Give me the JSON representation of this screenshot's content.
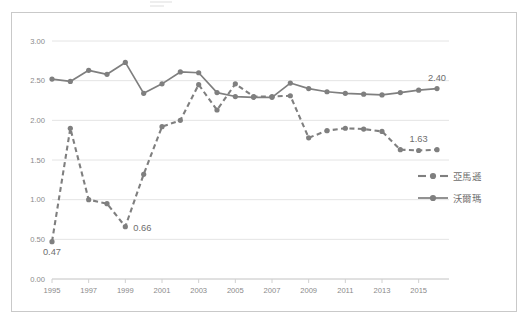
{
  "chart_data": {
    "type": "line",
    "title": "",
    "subtitle": "",
    "xlabel": "",
    "ylabel": "",
    "xlim": [
      1995,
      2016
    ],
    "ylim": [
      0.0,
      3.0
    ],
    "ytick_values": [
      0.0,
      0.5,
      1.0,
      1.5,
      2.0,
      2.5,
      3.0
    ],
    "ytick_labels": [
      "0.00",
      "0.50",
      "1.00",
      "1.50",
      "2.00",
      "2.50",
      "3.00"
    ],
    "xtick_values": [
      1995,
      1997,
      1999,
      2001,
      2003,
      2005,
      2007,
      2009,
      2011,
      2013,
      2015
    ],
    "xtick_labels": [
      "1995",
      "1997",
      "1999",
      "2001",
      "2003",
      "2005",
      "2007",
      "2009",
      "2011",
      "2013",
      "2015"
    ],
    "x": [
      1995,
      1996,
      1997,
      1998,
      1999,
      2000,
      2001,
      2002,
      2003,
      2004,
      2005,
      2006,
      2007,
      2008,
      2009,
      2010,
      2011,
      2012,
      2013,
      2014,
      2015,
      2016
    ],
    "grid": "horizontal",
    "legend_position": "right",
    "series": [
      {
        "name": "亞馬遜",
        "style": "dashed",
        "marker": "circle",
        "color": "#7f7f7f",
        "values": [
          0.47,
          1.9,
          1.0,
          0.95,
          0.66,
          1.32,
          1.92,
          2.0,
          2.45,
          2.13,
          2.46,
          2.3,
          2.3,
          2.31,
          1.78,
          1.87,
          1.9,
          1.89,
          1.86,
          1.63,
          1.62,
          1.63
        ]
      },
      {
        "name": "沃爾瑪",
        "style": "solid",
        "marker": "circle",
        "color": "#7f7f7f",
        "values": [
          2.52,
          2.49,
          2.63,
          2.58,
          2.73,
          2.34,
          2.46,
          2.61,
          2.6,
          2.35,
          2.3,
          2.29,
          2.29,
          2.47,
          2.4,
          2.36,
          2.34,
          2.33,
          2.32,
          2.35,
          2.38,
          2.4
        ]
      }
    ],
    "annotations": [
      {
        "text": "0.47",
        "series": "亞馬遜",
        "x": 1995,
        "y": 0.47,
        "position": "below"
      },
      {
        "text": "0.66",
        "series": "亞馬遜",
        "x": 1999,
        "y": 0.66,
        "position": "right"
      },
      {
        "text": "1.63",
        "series": "亞馬遜",
        "x": 2015,
        "y": 1.63,
        "position": "above"
      },
      {
        "text": "2.40",
        "series": "沃爾瑪",
        "x": 2016,
        "y": 2.4,
        "position": "above"
      }
    ]
  },
  "legend": {
    "items": [
      {
        "label": "亞馬遜",
        "style": "dashed"
      },
      {
        "label": "沃爾瑪",
        "style": "solid"
      }
    ]
  }
}
